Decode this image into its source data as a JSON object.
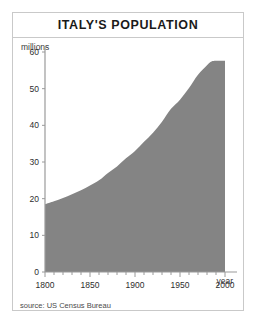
{
  "chart_data": {
    "type": "area",
    "title": "ITALY'S POPULATION",
    "xlabel": "year",
    "ylabel": "millions",
    "source": "source: US Census Bureau",
    "xlim": [
      1800,
      2000
    ],
    "ylim": [
      0,
      60
    ],
    "xticks": [
      1800,
      1850,
      1900,
      1950,
      2000
    ],
    "xtick_labels": [
      "1800",
      "1850",
      "1900",
      "1950",
      "2000"
    ],
    "minor_xtick_step": 10,
    "yticks": [
      0,
      10,
      20,
      30,
      40,
      50,
      60
    ],
    "ytick_labels": [
      "0",
      "10",
      "20",
      "30",
      "40",
      "50",
      "60"
    ],
    "grid": false,
    "legend": false,
    "fill_color": "#848484",
    "axis_color": "#9a9a9a",
    "x": [
      1800,
      1810,
      1820,
      1830,
      1840,
      1850,
      1860,
      1870,
      1880,
      1890,
      1900,
      1910,
      1920,
      1930,
      1940,
      1950,
      1960,
      1970,
      1980,
      1985,
      1990,
      2000
    ],
    "values": [
      18.5,
      19.3,
      20.2,
      21.2,
      22.3,
      23.6,
      25.0,
      27.0,
      28.8,
      31.0,
      33.0,
      35.5,
      38.0,
      41.0,
      44.5,
      47.0,
      50.2,
      53.8,
      56.4,
      57.4,
      57.6,
      57.6
    ],
    "series": [
      {
        "name": "Italy population (millions)",
        "values": [
          18.5,
          19.3,
          20.2,
          21.2,
          22.3,
          23.6,
          25.0,
          27.0,
          28.8,
          31.0,
          33.0,
          35.5,
          38.0,
          41.0,
          44.5,
          47.0,
          50.2,
          53.8,
          56.4,
          57.4,
          57.6,
          57.6
        ]
      }
    ]
  },
  "card": {
    "title": "ITALY'S POPULATION"
  },
  "axes": {
    "y_axis_caption": "millions",
    "x_axis_caption": "year"
  },
  "footer": {
    "source": "source: US Census Bureau"
  }
}
